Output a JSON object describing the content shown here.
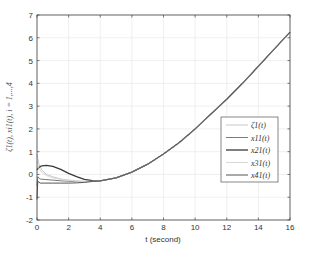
{
  "chart_data": {
    "type": "line",
    "title": "",
    "xlabel": "t (second)",
    "ylabel": "ζ1(t), xi1(t), i = 1,...,4",
    "xlim": [
      0,
      16
    ],
    "ylim": [
      -2,
      7
    ],
    "xticks": [
      0,
      2,
      4,
      6,
      8,
      10,
      12,
      14,
      16
    ],
    "yticks": [
      -2,
      -1,
      0,
      1,
      2,
      3,
      4,
      5,
      6,
      7
    ],
    "grid": true,
    "legend_position": "right-center",
    "series": [
      {
        "name": "ζ1(t)",
        "color": "#c8c8c8",
        "x": [
          0,
          0.1,
          0.3,
          0.6,
          1.0,
          1.5,
          2.0,
          2.5,
          3.0,
          3.5,
          4,
          5,
          6,
          7,
          8,
          9,
          10,
          11,
          12,
          13,
          14,
          15,
          16
        ],
        "y": [
          0.9,
          0.5,
          0.2,
          0.0,
          -0.1,
          -0.2,
          -0.25,
          -0.28,
          -0.3,
          -0.3,
          -0.28,
          -0.15,
          0.1,
          0.45,
          0.9,
          1.4,
          2.0,
          2.65,
          3.3,
          4.0,
          4.75,
          5.5,
          6.25
        ]
      },
      {
        "name": "x11(t)",
        "color": "#7a7a7a",
        "x": [
          0,
          0.05,
          0.2,
          0.5,
          1.0,
          1.5,
          2.0,
          2.5,
          3.0,
          3.5,
          4,
          5,
          6,
          7,
          8,
          9,
          10,
          11,
          12,
          13,
          14,
          15,
          16
        ],
        "y": [
          -0.5,
          -0.1,
          -0.2,
          -0.22,
          -0.25,
          -0.28,
          -0.3,
          -0.32,
          -0.32,
          -0.3,
          -0.28,
          -0.15,
          0.1,
          0.45,
          0.9,
          1.4,
          2.0,
          2.65,
          3.3,
          4.0,
          4.75,
          5.5,
          6.25
        ]
      },
      {
        "name": "x21(t)",
        "color": "#3a3a3a",
        "x": [
          0,
          0.1,
          0.3,
          0.6,
          1.0,
          1.5,
          2.0,
          2.5,
          3.0,
          3.5,
          4,
          5,
          6,
          7,
          8,
          9,
          10,
          11,
          12,
          13,
          14,
          15,
          16
        ],
        "y": [
          0.2,
          0.3,
          0.38,
          0.4,
          0.35,
          0.22,
          0.05,
          -0.1,
          -0.22,
          -0.27,
          -0.28,
          -0.15,
          0.1,
          0.45,
          0.9,
          1.4,
          2.0,
          2.65,
          3.3,
          4.0,
          4.75,
          5.5,
          6.25
        ]
      },
      {
        "name": "x31(t)",
        "color": "#d8d8d8",
        "x": [
          0,
          0.1,
          0.3,
          0.6,
          1.0,
          1.5,
          2.0,
          2.5,
          3.0,
          3.5,
          4,
          5,
          6,
          7,
          8,
          9,
          10,
          11,
          12,
          13,
          14,
          15,
          16
        ],
        "y": [
          0.6,
          0.3,
          0.1,
          -0.05,
          -0.15,
          -0.22,
          -0.27,
          -0.3,
          -0.31,
          -0.3,
          -0.28,
          -0.15,
          0.1,
          0.45,
          0.9,
          1.4,
          2.0,
          2.65,
          3.3,
          4.0,
          4.75,
          5.5,
          6.25
        ]
      },
      {
        "name": "x41(t)",
        "color": "#555555",
        "x": [
          0,
          0.05,
          0.2,
          0.5,
          1.0,
          1.5,
          2.0,
          2.5,
          3.0,
          3.5,
          4,
          5,
          6,
          7,
          8,
          9,
          10,
          11,
          12,
          13,
          14,
          15,
          16
        ],
        "y": [
          -1.1,
          -0.3,
          -0.38,
          -0.38,
          -0.38,
          -0.38,
          -0.38,
          -0.37,
          -0.35,
          -0.31,
          -0.28,
          -0.15,
          0.1,
          0.45,
          0.9,
          1.4,
          2.0,
          2.65,
          3.3,
          4.0,
          4.75,
          5.5,
          6.25
        ]
      }
    ]
  }
}
